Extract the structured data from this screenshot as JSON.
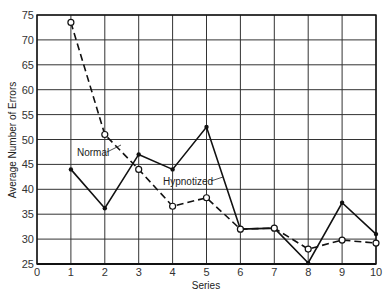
{
  "chart_data": {
    "type": "line",
    "title": "",
    "xlabel": "Series",
    "ylabel": "Average Number of Errors",
    "x": [
      1,
      2,
      3,
      4,
      5,
      6,
      7,
      8,
      9,
      10
    ],
    "xlim": [
      0,
      10
    ],
    "ylim": [
      25,
      75
    ],
    "x_ticks": [
      0,
      1,
      2,
      3,
      4,
      5,
      6,
      7,
      8,
      9,
      10
    ],
    "y_ticks": [
      25,
      30,
      35,
      40,
      45,
      50,
      55,
      60,
      65,
      70,
      75
    ],
    "grid": true,
    "legend": "inline annotations",
    "series": [
      {
        "name": "Normal",
        "style": "solid line, filled dot markers",
        "values": [
          44.0,
          36.2,
          47.0,
          44.0,
          52.5,
          32.0,
          32.2,
          25.2,
          37.3,
          31.0
        ]
      },
      {
        "name": "Hypnotized",
        "style": "dashed line, open circle markers",
        "values": [
          73.5,
          51.0,
          44.0,
          36.6,
          38.3,
          32.0,
          32.2,
          28.0,
          29.8,
          29.2
        ]
      }
    ],
    "annotations": [
      {
        "text": "Normal",
        "arrow_to_series": "Normal"
      },
      {
        "text": "Hypnotized",
        "arrow_to_series": "Hypnotized"
      }
    ]
  }
}
